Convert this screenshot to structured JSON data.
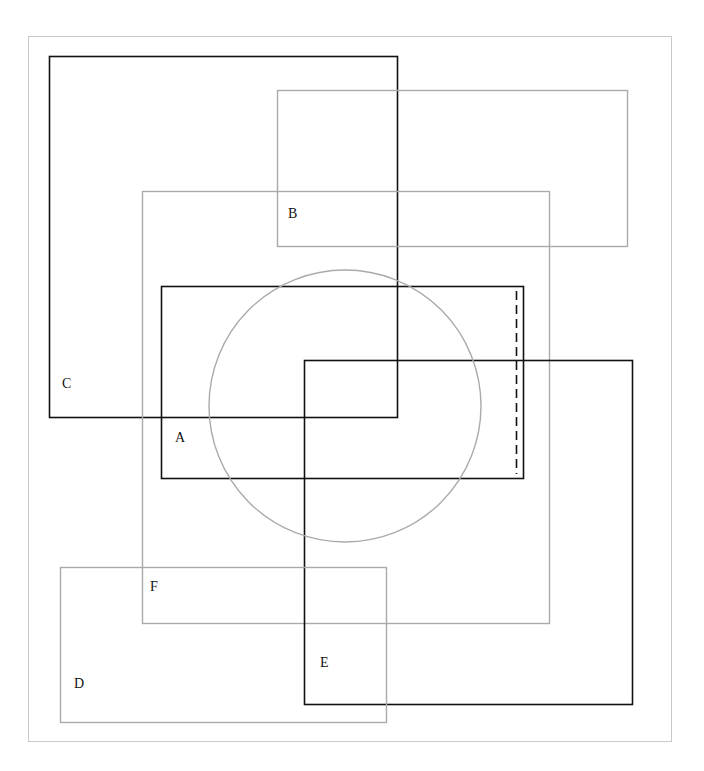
{
  "diagram": {
    "type": "overlapping-shapes",
    "frame": {
      "x": 28,
      "y": 36,
      "w": 643,
      "h": 705,
      "stroke": "#c8c8c8"
    },
    "colors": {
      "dark": "#111111",
      "light": "#aaaaaa"
    },
    "shapes": [
      {
        "id": "C",
        "kind": "rect",
        "x": 49,
        "y": 56,
        "w": 348,
        "h": 361,
        "stroke": "dark",
        "label": "C",
        "label_x": 62,
        "label_y": 388
      },
      {
        "id": "B",
        "kind": "rect",
        "x": 277,
        "y": 90,
        "w": 350,
        "h": 156,
        "stroke": "light",
        "label": "B",
        "label_x": 288,
        "label_y": 218
      },
      {
        "id": "F",
        "kind": "rect",
        "x": 142,
        "y": 191,
        "w": 407,
        "h": 432,
        "stroke": "light",
        "label": "F",
        "label_x": 150,
        "label_y": 591
      },
      {
        "id": "A",
        "kind": "rect",
        "x": 161,
        "y": 286,
        "w": 362,
        "h": 192,
        "stroke": "dark",
        "label": "A",
        "label_x": 175,
        "label_y": 442
      },
      {
        "id": "E",
        "kind": "rect",
        "x": 304,
        "y": 360,
        "w": 328,
        "h": 344,
        "stroke": "dark",
        "label": "E",
        "label_x": 320,
        "label_y": 667
      },
      {
        "id": "D",
        "kind": "rect",
        "x": 60,
        "y": 567,
        "w": 326,
        "h": 155,
        "stroke": "light",
        "label": "D",
        "label_x": 74,
        "label_y": 688
      },
      {
        "id": "circle",
        "kind": "circle",
        "cx": 345,
        "cy": 406,
        "r": 136,
        "stroke": "light"
      },
      {
        "id": "dashed",
        "kind": "dashed-line",
        "x": 516,
        "y1": 291,
        "y2": 474,
        "stroke": "dark",
        "dash": "9,5"
      }
    ],
    "labels": [
      "A",
      "B",
      "C",
      "D",
      "E",
      "F"
    ]
  }
}
